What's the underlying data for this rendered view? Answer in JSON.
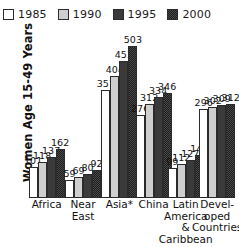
{
  "chart_data": {
    "type": "bar",
    "title": "",
    "xlabel": "",
    "ylabel": "Women Age 15-49 Years",
    "grid": false,
    "legend_position": "top",
    "ylim": [
      0,
      503
    ],
    "categories": [
      "Africa",
      "Near\nEast",
      "Asia*",
      "China",
      "Latin\nAmerica\n&\nCaribbean",
      "Devel-\noped\nCountries"
    ],
    "series": [
      {
        "name": "1985",
        "color": "#ffffff",
        "values": [
          101,
          59,
          357,
          276,
          99,
          296
        ]
      },
      {
        "name": "1990",
        "color": "#cfcfcf",
        "values": [
          118,
          69,
          404,
          312,
          112,
          302
        ]
      },
      {
        "name": "1995",
        "color": "#3a3a3a",
        "values": [
          137,
          80,
          453,
          334,
          127,
          309
        ]
      },
      {
        "name": "2000",
        "color": "#4a4a4a",
        "values": [
          162,
          92,
          503,
          346,
          141,
          312
        ]
      }
    ]
  },
  "legend": {
    "items": [
      {
        "label": "1985"
      },
      {
        "label": "1990"
      },
      {
        "label": "1995"
      },
      {
        "label": "2000"
      }
    ]
  },
  "axis": {
    "y_title": "Women Age 15-49 Years"
  },
  "categories": [
    {
      "lines": [
        "Africa"
      ]
    },
    {
      "lines": [
        "Near",
        "East"
      ]
    },
    {
      "lines": [
        "Asia*"
      ]
    },
    {
      "lines": [
        "China"
      ]
    },
    {
      "lines": [
        "Latin",
        "America",
        "&",
        "Caribbean"
      ]
    },
    {
      "lines": [
        "Devel-",
        "oped",
        "Countries"
      ]
    }
  ]
}
